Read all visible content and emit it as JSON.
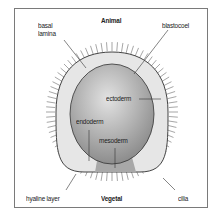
{
  "diagram": {
    "poles": {
      "top": "Animal",
      "bottom": "Vegetal"
    },
    "labels": {
      "basal_lamina_1": "basal",
      "basal_lamina_2": "lamina",
      "blastocoel": "blastocoel",
      "ectoderm": "ectoderm",
      "endoderm": "endoderm",
      "mesoderm": "mesoderm",
      "hyaline_layer": "hyaline layer",
      "cilia": "cilia"
    },
    "colors": {
      "frame": "#7a7a7a",
      "hyaline_fill": "#e6e6e6",
      "blastocoel_light": "#dcdcdc",
      "blastocoel_dark": "#8a8a8a",
      "mesoderm_fill": "#a8a8a8",
      "cilia": "#6a6a6a"
    }
  }
}
